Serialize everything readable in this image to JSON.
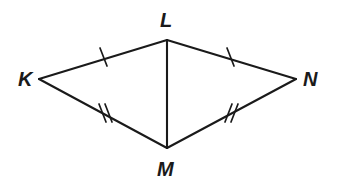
{
  "figure": {
    "kind": "geometry-diagram",
    "shape_name": "kite KLMN",
    "background_color": "#ffffff",
    "stroke_color": "#1a1a1a",
    "vertices": [
      {
        "id": "K",
        "label": "K",
        "x": 39,
        "y": 79,
        "label_x": 18,
        "label_y": 86
      },
      {
        "id": "L",
        "label": "L",
        "x": 167,
        "y": 40,
        "label_x": 160,
        "label_y": 27
      },
      {
        "id": "N",
        "label": "N",
        "x": 296,
        "y": 79,
        "label_x": 303,
        "label_y": 86
      },
      {
        "id": "M",
        "label": "M",
        "x": 167,
        "y": 148,
        "label_x": 157,
        "label_y": 176
      }
    ],
    "segments": [
      {
        "id": "KL",
        "from": "K",
        "to": "L",
        "x1": 39,
        "y1": 79,
        "x2": 167,
        "y2": 40,
        "ticks": 1
      },
      {
        "id": "LN",
        "from": "L",
        "to": "N",
        "x1": 167,
        "y1": 40,
        "x2": 296,
        "y2": 79,
        "ticks": 1
      },
      {
        "id": "KM",
        "from": "K",
        "to": "M",
        "x1": 39,
        "y1": 79,
        "x2": 167,
        "y2": 148,
        "ticks": 2
      },
      {
        "id": "MN",
        "from": "M",
        "to": "N",
        "x1": 167,
        "y1": 148,
        "x2": 296,
        "y2": 79,
        "ticks": 2
      },
      {
        "id": "LM",
        "from": "L",
        "to": "M",
        "x1": 167,
        "y1": 40,
        "x2": 167,
        "y2": 148,
        "ticks": 0
      }
    ],
    "tick_marks": [
      {
        "id": "tick-KL-1",
        "segment": "KL",
        "x1": 100,
        "y1": 48,
        "x2": 107,
        "y2": 66
      },
      {
        "id": "tick-LN-1",
        "segment": "LN",
        "x1": 227,
        "y1": 48,
        "x2": 234,
        "y2": 66
      },
      {
        "id": "tick-KM-1",
        "segment": "KM",
        "x1": 99,
        "y1": 104,
        "x2": 106,
        "y2": 122
      },
      {
        "id": "tick-KM-2",
        "segment": "KM",
        "x1": 105,
        "y1": 104,
        "x2": 112,
        "y2": 122
      },
      {
        "id": "tick-MN-1",
        "segment": "MN",
        "x1": 225,
        "y1": 122,
        "x2": 232,
        "y2": 104
      },
      {
        "id": "tick-MN-2",
        "segment": "MN",
        "x1": 231,
        "y1": 122,
        "x2": 238,
        "y2": 104
      }
    ]
  }
}
